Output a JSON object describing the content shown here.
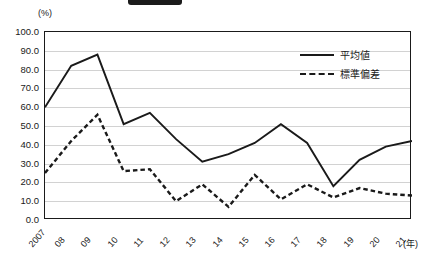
{
  "unit_label": "(%)",
  "xaxis_unit_label": "(年)",
  "legend": {
    "position": "top-right",
    "entries": [
      {
        "label": "平均値",
        "style": "solid"
      },
      {
        "label": "標準偏差",
        "style": "dashed"
      }
    ]
  },
  "colors": {
    "line": "#1a1a1a",
    "grid": "#d2d2d2",
    "frame": "#1a1a1a",
    "background": "#ffffff"
  },
  "chart_data": {
    "type": "line",
    "title": "",
    "xlabel": "(年)",
    "ylabel": "(%)",
    "ylim": [
      0,
      100
    ],
    "ytick_step": 10,
    "ytick_labels": [
      "100.0",
      "90.0",
      "80.0",
      "70.0",
      "60.0",
      "50.0",
      "40.0",
      "30.0",
      "20.0",
      "10.0",
      "0.0"
    ],
    "ytick_values": [
      100,
      90,
      80,
      70,
      60,
      50,
      40,
      30,
      20,
      10,
      0
    ],
    "grid": true,
    "categories": [
      "2007",
      "08",
      "09",
      "10",
      "11",
      "12",
      "13",
      "14",
      "15",
      "16",
      "17",
      "18",
      "19",
      "20",
      "21"
    ],
    "series": [
      {
        "name": "平均値",
        "style": "solid",
        "values": [
          60.0,
          82.0,
          88.0,
          51.0,
          57.0,
          43.0,
          31.0,
          35.0,
          41.0,
          51.0,
          41.0,
          18.0,
          32.0,
          39.0,
          42.0
        ]
      },
      {
        "name": "標準偏差",
        "style": "dashed",
        "values": [
          25.0,
          42.0,
          56.0,
          26.0,
          27.0,
          10.0,
          19.0,
          7.0,
          24.0,
          11.0,
          19.0,
          12.0,
          17.0,
          14.0,
          13.0
        ]
      }
    ]
  }
}
